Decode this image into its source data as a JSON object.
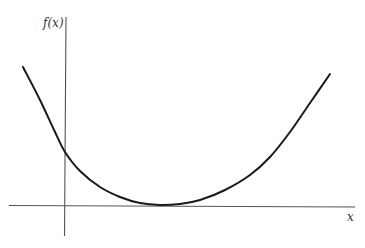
{
  "chart_data": {
    "type": "line",
    "title": "",
    "xlabel": "x",
    "ylabel": "f(x)",
    "grid": false,
    "legend": null,
    "ticks": "none",
    "series": [
      {
        "name": "f(x)",
        "points_px": [
          [
            23,
            67
          ],
          [
            40,
            100
          ],
          [
            55,
            132
          ],
          [
            65,
            152
          ],
          [
            80,
            171
          ],
          [
            100,
            187
          ],
          [
            120,
            197
          ],
          [
            140,
            203
          ],
          [
            160,
            205
          ],
          [
            180,
            204
          ],
          [
            200,
            200
          ],
          [
            225,
            190
          ],
          [
            250,
            175
          ],
          [
            270,
            157
          ],
          [
            290,
            132
          ],
          [
            310,
            103
          ],
          [
            330,
            74
          ]
        ]
      }
    ],
    "axes": {
      "origin_px": [
        65,
        206
      ],
      "x_axis_px": [
        9,
        355
      ],
      "y_axis_px": [
        17,
        236
      ]
    },
    "colors": {
      "curve": "#1a1a1a",
      "axis": "#555555"
    }
  },
  "labels": {
    "y_axis": "f(x)",
    "x_axis": "x"
  }
}
